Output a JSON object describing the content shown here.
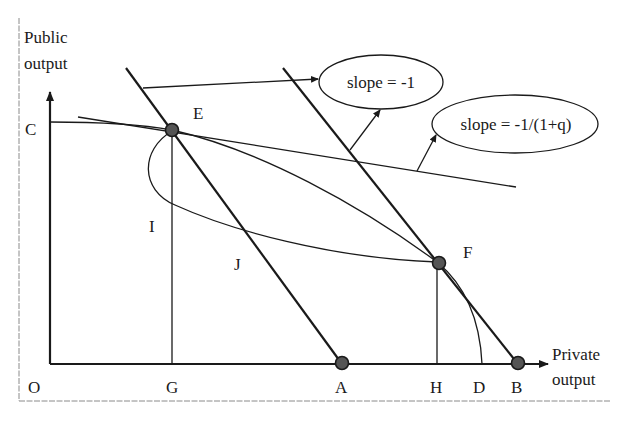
{
  "figure": {
    "y_axis_label_line1": "Public",
    "y_axis_label_line2": "output",
    "x_axis_label_line1": "Private",
    "x_axis_label_line2": "output",
    "origin_label": "O",
    "points": {
      "C": "C",
      "E": "E",
      "F": "F",
      "G": "G",
      "A": "A",
      "H": "H",
      "D": "D",
      "B": "B",
      "I": "I",
      "J": "J"
    },
    "callouts": {
      "slope_minus_one": "slope = -1",
      "slope_minus_one_over_one_plus_q": "slope = -1/(1+q)"
    }
  },
  "colors": {
    "ink": "#1a1a1a",
    "frame": "#8a8a8a",
    "dot_fill": "#555555",
    "background": "#ffffff"
  }
}
